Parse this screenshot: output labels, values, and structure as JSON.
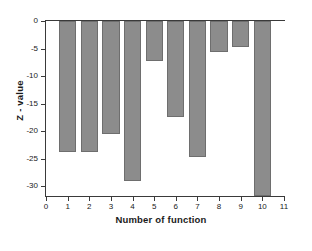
{
  "chart_data": {
    "type": "bar",
    "title": "",
    "xlabel": "Number of function",
    "ylabel": "Z - value",
    "categories": [
      "1",
      "2",
      "3",
      "4",
      "5",
      "6",
      "7",
      "8",
      "9",
      "10"
    ],
    "values": [
      -23.8,
      -23.8,
      -20.5,
      -29.1,
      -7.3,
      -17.5,
      -24.7,
      -5.7,
      -4.7,
      -31.8
    ],
    "value_notes": {
      "10": "bar extends past the bottom of the visible axis (clipped at the axis floor)"
    },
    "xlim": [
      0,
      11
    ],
    "ylim": [
      -31.8,
      0
    ],
    "xticks": [
      "0",
      "1",
      "2",
      "3",
      "4",
      "5",
      "6",
      "7",
      "8",
      "9",
      "10",
      "11"
    ],
    "yticks": [
      "0",
      "-5",
      "-10",
      "-15",
      "-20",
      "-25",
      "-30"
    ],
    "ytick_values": [
      0,
      -5,
      -10,
      -15,
      -20,
      -25,
      -30
    ],
    "grid": false,
    "legend": null,
    "legend_position": "none",
    "bar_color": "#8c8c8c",
    "bar_edge_color": "#6e6e6e",
    "axis_color": "#3a3a3a",
    "background_color": "#ffffff"
  }
}
